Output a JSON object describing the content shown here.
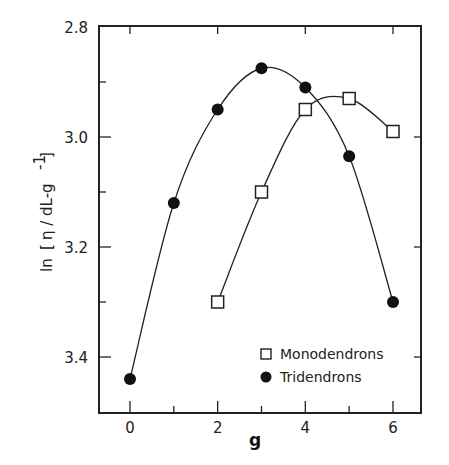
{
  "chart_data": {
    "type": "line",
    "title": "",
    "xlabel": "g",
    "ylabel": "ln [η / dL-g⁻¹]",
    "xlim": [
      -0.7,
      6.6
    ],
    "ylim": [
      3.5,
      2.8
    ],
    "y_inverted": true,
    "x_ticks": [
      0,
      2,
      4,
      6
    ],
    "x_tick_labels": [
      "0",
      "2",
      "4",
      "6"
    ],
    "x_minor_ticks": [
      1,
      3,
      5
    ],
    "y_ticks": [
      2.8,
      3.0,
      3.2,
      3.4
    ],
    "y_tick_labels": [
      "2.8",
      "3.0",
      "3.2",
      "3.4"
    ],
    "y_minor_ticks": [
      2.9,
      3.1,
      3.3
    ],
    "grid": false,
    "legend_position": "lower right",
    "series": [
      {
        "name": "Monodendrons",
        "marker": "open-square",
        "x": [
          2,
          3,
          4,
          5,
          6
        ],
        "values": [
          3.3,
          3.1,
          2.95,
          2.93,
          2.99
        ]
      },
      {
        "name": "Tridendrons",
        "marker": "filled-circle",
        "x": [
          0,
          1,
          2,
          3,
          4,
          5,
          6
        ],
        "values": [
          3.44,
          3.12,
          2.95,
          2.875,
          2.91,
          3.035,
          3.3
        ]
      }
    ]
  },
  "legend": {
    "items": [
      {
        "label": "Monodendrons",
        "marker": "open-square"
      },
      {
        "label": "Tridendrons",
        "marker": "filled-circle"
      }
    ]
  },
  "axes": {
    "x_label": "g",
    "y_label_prefix": "ln",
    "y_label_bracket": "η / dL-g",
    "y_label_sup": "-1"
  }
}
